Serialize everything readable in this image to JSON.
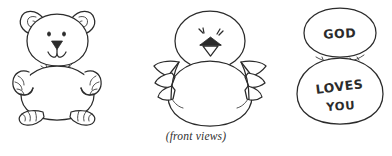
{
  "page": {
    "background_color": "#ffffff",
    "ink_color": "#2b2b2b",
    "caption": "(front views)"
  },
  "figures": [
    {
      "id": "bear",
      "name": "teddy-bear-figure",
      "label": "teddy bear",
      "parts": [
        "left-ear",
        "right-ear",
        "head",
        "eyes",
        "nose",
        "mouth",
        "neck-fur-tuft",
        "body",
        "left-paw",
        "right-paw",
        "left-foot",
        "right-foot"
      ]
    },
    {
      "id": "chick",
      "name": "chick-figure",
      "label": "chick",
      "parts": [
        "head",
        "eyes",
        "open-beak",
        "body",
        "left-wing",
        "right-wing"
      ]
    },
    {
      "id": "eggs",
      "name": "message-ovals-figure",
      "label": "stacked ovals with message",
      "parts": [
        "top-oval",
        "bottom-oval",
        "neck-fur-tuft",
        "top-text",
        "bottom-text-line-1",
        "bottom-text-line-2"
      ],
      "text": {
        "top": "GOD",
        "bottom_line_1": "LOVES",
        "bottom_line_2": "YOU"
      }
    }
  ]
}
